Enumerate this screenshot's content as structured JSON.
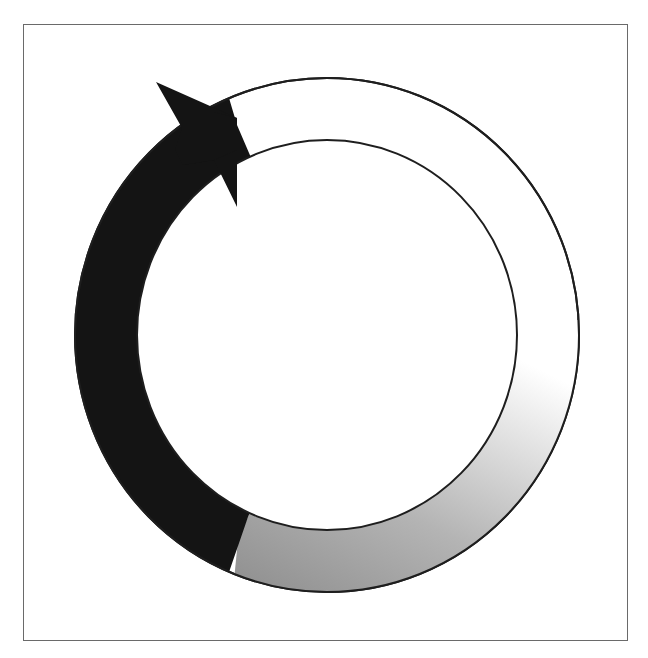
{
  "diagram": {
    "type": "circular-cycle-arrow",
    "colors": {
      "frame": "#6a6a6a",
      "arrow_fill": "#141414",
      "gradient_start": "#8c8c8c",
      "gradient_end": "#ffffff",
      "outline": "#1e1e1e",
      "background": "#ffffff"
    },
    "ring": {
      "center": [
        327,
        335
      ],
      "outer_radius": [
        252,
        257
      ],
      "inner_radius": [
        190,
        195
      ]
    },
    "segments": [
      {
        "name": "dark-arrow-segment",
        "fill": "#141414",
        "from": "bottom-left",
        "to": "top-left with arrowhead"
      },
      {
        "name": "gradient-segment",
        "fill": "gray-to-white gradient",
        "from": "bottom",
        "to": "right"
      },
      {
        "name": "empty-segment",
        "fill": "#ffffff",
        "from": "right",
        "to": "top"
      }
    ]
  }
}
